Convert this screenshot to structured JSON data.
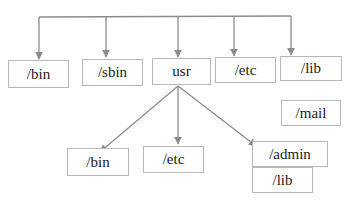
{
  "diagram": {
    "type": "directory-tree",
    "colors": {
      "line": "#8c8c8c",
      "box_border": "#b8b8b8",
      "text": "#222222"
    },
    "top_level": [
      {
        "id": "bin",
        "label": "/bin"
      },
      {
        "id": "sbin",
        "label": "/sbin"
      },
      {
        "id": "usr",
        "label": "usr"
      },
      {
        "id": "etc",
        "label": "/etc"
      },
      {
        "id": "lib",
        "label": "/lib"
      }
    ],
    "extra": [
      {
        "id": "mail",
        "label": "/mail"
      }
    ],
    "usr_children": [
      {
        "id": "usr-bin",
        "label": "/bin"
      },
      {
        "id": "usr-etc",
        "label": "/etc"
      },
      {
        "id": "usr-admin",
        "label": "/admin"
      },
      {
        "id": "usr-lib",
        "label": "/lib"
      }
    ],
    "edges": [
      {
        "from": "root",
        "to": "bin"
      },
      {
        "from": "root",
        "to": "sbin"
      },
      {
        "from": "root",
        "to": "usr"
      },
      {
        "from": "root",
        "to": "etc"
      },
      {
        "from": "root",
        "to": "lib"
      },
      {
        "from": "usr",
        "to": "usr-bin"
      },
      {
        "from": "usr",
        "to": "usr-etc"
      },
      {
        "from": "usr",
        "to": "usr-admin"
      }
    ]
  }
}
